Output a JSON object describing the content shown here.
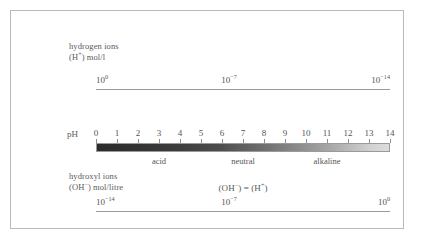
{
  "figure": {
    "border_color": "#b9b9b9",
    "background": "#ffffff"
  },
  "top_section": {
    "caption_line1": "hydrogen ions",
    "caption_line2_prefix": "(H",
    "caption_line2_sup": "+",
    "caption_line2_suffix": ") mol/l",
    "values": [
      {
        "mantissa": "10",
        "exponent": "0",
        "align": "left"
      },
      {
        "mantissa": "10",
        "exponent": "−7",
        "align": "center"
      },
      {
        "mantissa": "10",
        "exponent": "−14",
        "align": "right"
      }
    ]
  },
  "ph_scale": {
    "axis_label": "pH",
    "ticks": [
      "0",
      "1",
      "2",
      "3",
      "4",
      "5",
      "6",
      "7",
      "8",
      "9",
      "10",
      "11",
      "12",
      "13",
      "14"
    ],
    "min": 0,
    "max": 14,
    "gradient_from": "#2c2c2c",
    "gradient_to": "#dcdcdc",
    "regions": [
      {
        "name": "acid",
        "center_ph": 3
      },
      {
        "name": "neutral",
        "center_ph": 7
      },
      {
        "name": "alkaline",
        "center_ph": 11
      }
    ]
  },
  "bottom_section": {
    "caption_line1": "hydroxyl ions",
    "caption_line2_prefix": "(OH",
    "caption_line2_sup": "−",
    "caption_line2_suffix": ") mol/litre",
    "equation": "(OH−) = (H+)",
    "equation_parts": {
      "oh_open": "(OH",
      "oh_sup": "−",
      "oh_close": ")",
      "equals": "=",
      "h_open": "(H",
      "h_sup": "+",
      "h_close": ")"
    },
    "values": [
      {
        "mantissa": "10",
        "exponent": "−14",
        "align": "left"
      },
      {
        "mantissa": "10",
        "exponent": "−7",
        "align": "center"
      },
      {
        "mantissa": "10",
        "exponent": "0",
        "align": "right"
      }
    ]
  },
  "chart_data": {
    "type": "bar",
    "categories": [
      "0",
      "1",
      "2",
      "3",
      "4",
      "5",
      "6",
      "7",
      "8",
      "9",
      "10",
      "11",
      "12",
      "13",
      "14"
    ],
    "values": [
      0,
      1,
      2,
      3,
      4,
      5,
      6,
      7,
      8,
      9,
      10,
      11,
      12,
      13,
      14
    ],
    "xlabel": "pH",
    "ylabel": "",
    "xlim": [
      0,
      14
    ],
    "grid": false,
    "legend": "none",
    "series": [
      {
        "name": "hydrogen ion concentration (H+) mol/l",
        "labels": [
          "10^0",
          "10^-7",
          "10^-14"
        ],
        "at_ph": [
          0,
          7,
          14
        ]
      },
      {
        "name": "hydroxyl ion concentration (OH-) mol/litre",
        "labels": [
          "10^-14",
          "10^-7",
          "10^0"
        ],
        "at_ph": [
          0,
          7,
          14
        ]
      }
    ],
    "annotations": [
      "acid",
      "neutral",
      "alkaline",
      "(OH-) = (H+)"
    ]
  }
}
